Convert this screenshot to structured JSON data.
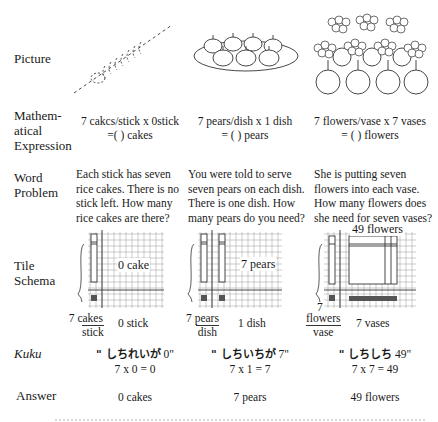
{
  "rows": {
    "picture": "Picture",
    "expression": [
      "Mathem-",
      "atical",
      "Expression"
    ],
    "word_problem": [
      "Word",
      "Problem"
    ],
    "tile_schema": [
      "Tile",
      "Schema"
    ],
    "kuku": "Kuku",
    "answer": "Answer"
  },
  "columns": [
    {
      "picture_icon": "rice-cakes-on-stick",
      "expression_line1": "7 cakcs/stick x 0stick",
      "expression_line2": "=( ) cakes",
      "word_problem": [
        "Each stick has seven",
        "rice cakes. There is no",
        "stick left. How many",
        "rice cakes are there?"
      ],
      "tile_label": "0 cake",
      "frac_num": "7 cakes",
      "frac_den": "stick",
      "multiplier": "0 stick",
      "kuku_kana": "\" しちれいが",
      "kuku_value": "0\"",
      "kuku_equation": "7 x 0 = 0",
      "answer": "0 cakes"
    },
    {
      "picture_icon": "pears-on-dish",
      "expression_line1": "7 pears/dish x 1 dish",
      "expression_line2": "= ( ) pears",
      "word_problem": [
        "You were told to serve",
        "seven pears on each dish.",
        "There is one dish. How",
        "many pears do you need?"
      ],
      "tile_label": "7 pears",
      "frac_num": "7 pears",
      "frac_den": "dish",
      "multiplier": "1 dish",
      "kuku_kana": "\" しちいちが",
      "kuku_value": "7\"",
      "kuku_equation": "7 x 1 = 7",
      "answer": "7 pears"
    },
    {
      "picture_icon": "flowers-in-vases",
      "expression_line1": "7 flowers/vase x 7 vases",
      "expression_line2": "= ( ) flowers",
      "word_problem": [
        "She is putting seven",
        "flowers into each vase.",
        "How many flowers does",
        "she need for seven vases?"
      ],
      "tile_label": "49 flowers",
      "frac_prefix": "7",
      "frac_num": "flowers",
      "frac_den": "vase",
      "multiplier": "7 vases",
      "kuku_kana": "\" しちしち",
      "kuku_value": "49\"",
      "kuku_equation": "7 x 7 = 49",
      "answer": "49 flowers"
    }
  ],
  "colors": {
    "ink": "#1a1a1a",
    "grid": "#9a9a9a",
    "tile_fill": "#555555"
  }
}
